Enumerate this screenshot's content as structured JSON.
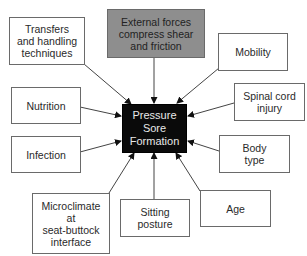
{
  "diagram": {
    "center": {
      "label": "Pressure\nSore\nFormation",
      "fill": "#0a0a0a",
      "text_color": "#e8e8e8"
    },
    "factors": [
      {
        "id": "transfers",
        "label": "Transfers\nand handling\ntechniques"
      },
      {
        "id": "external-forces",
        "label": "External forces\ncompress shear\nand friction",
        "fill": "#8e8e8e"
      },
      {
        "id": "mobility",
        "label": "Mobility"
      },
      {
        "id": "spinal-cord-injury",
        "label": "Spinal cord\ninjury"
      },
      {
        "id": "nutrition",
        "label": "Nutrition"
      },
      {
        "id": "infection",
        "label": "Infection"
      },
      {
        "id": "body-type",
        "label": "Body\ntype"
      },
      {
        "id": "microclimate",
        "label": "Microclimate\nat\nseat-buttock\ninterface"
      },
      {
        "id": "sitting-posture",
        "label": "Sitting\nposture"
      },
      {
        "id": "age",
        "label": "Age"
      }
    ],
    "edges_direction": "all factors point to center"
  }
}
